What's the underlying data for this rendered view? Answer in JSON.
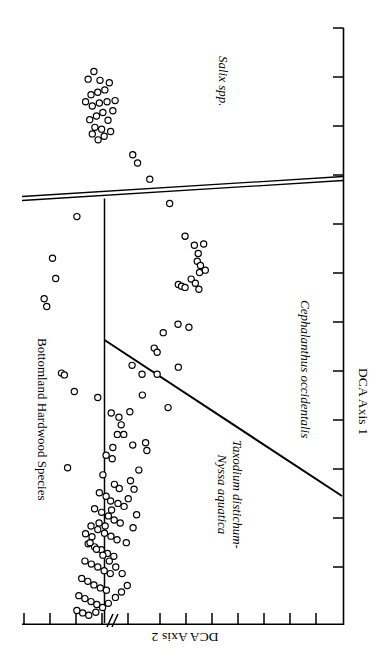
{
  "figure": {
    "kind": "DCA ordination scatter plot",
    "orientation_note": "landscape plot rotated 90 degrees clockwise on a portrait page",
    "background_color": "#ffffff",
    "ink_color": "#000000"
  },
  "axes": {
    "x_axis": {
      "name": "DCA Axis 1",
      "label": "DCA Axis 1",
      "label_rotation_deg": 90,
      "tick_count": 13,
      "has_break": false
    },
    "y_axis": {
      "name": "DCA Axis 2",
      "label": "DCA Axis 2",
      "label_rotation_deg": 180,
      "tick_count": 13,
      "has_break": true,
      "break_symbol": "//"
    }
  },
  "annotations": [
    {
      "id": "salix",
      "text": "Salix spp.",
      "style": "italic",
      "lines": [
        "Salix spp."
      ]
    },
    {
      "id": "bottomland",
      "text": "Bottomland Hardwood Species",
      "style": "normal",
      "lines": [
        "Bottomland Hardwood Species"
      ]
    },
    {
      "id": "cephalanthus",
      "text": "Cephalanthus occidentalis",
      "style": "italic",
      "lines": [
        "Cephalanthus occidentalis"
      ]
    },
    {
      "id": "taxodium",
      "text": "Taxodium distichum-Nyssa aquatica",
      "style": "italic",
      "lines": [
        "Taxodium distichum-",
        "Nyssa aquatica"
      ]
    }
  ],
  "chart_data": {
    "type": "scatter",
    "title": "",
    "subtitle": "",
    "xlabel": "DCA Axis 1",
    "ylabel": "DCA Axis 2",
    "xlim": [
      0,
      1
    ],
    "ylim": [
      0,
      1
    ],
    "grid": false,
    "legend": "none",
    "marker": {
      "shape": "circle",
      "fill": "#ffffff",
      "stroke": "#000000",
      "radius_px": 3.1,
      "stroke_width_px": 1.2
    },
    "axis_note": "Normalized plot coordinates: x = DCA Axis 1 (0 at left of plot frame), y = DCA Axis 2 (0 at bottom of plot frame).",
    "groups": [
      {
        "name": "Salix spp.",
        "label_style": "italic",
        "points": [
          [
            0.206,
            0.914
          ],
          [
            0.224,
            0.927
          ],
          [
            0.243,
            0.912
          ],
          [
            0.236,
            0.892
          ],
          [
            0.215,
            0.888
          ],
          [
            0.198,
            0.876
          ],
          [
            0.219,
            0.869
          ],
          [
            0.241,
            0.874
          ],
          [
            0.258,
            0.896
          ],
          [
            0.272,
            0.908
          ],
          [
            0.265,
            0.876
          ],
          [
            0.252,
            0.858
          ],
          [
            0.232,
            0.852
          ],
          [
            0.211,
            0.846
          ],
          [
            0.227,
            0.833
          ],
          [
            0.248,
            0.83
          ],
          [
            0.268,
            0.845
          ],
          [
            0.283,
            0.861
          ],
          [
            0.29,
            0.878
          ],
          [
            0.276,
            0.826
          ],
          [
            0.256,
            0.818
          ],
          [
            0.237,
            0.812
          ],
          [
            0.219,
            0.822
          ]
        ]
      },
      {
        "name": "Salix spp. outliers",
        "label_style": "italic",
        "points": [
          [
            0.345,
            0.787
          ],
          [
            0.36,
            0.773
          ],
          [
            0.398,
            0.746
          ],
          [
            0.46,
            0.705
          ],
          [
            0.171,
            0.683
          ]
        ]
      },
      {
        "name": "Bottomland Hardwood Species",
        "label_style": "normal",
        "points": [
          [
            0.095,
            0.613
          ],
          [
            0.105,
            0.579
          ],
          [
            0.069,
            0.545
          ],
          [
            0.077,
            0.532
          ],
          [
            0.123,
            0.42
          ],
          [
            0.132,
            0.417
          ],
          [
            0.163,
            0.389
          ],
          [
            0.142,
            0.261
          ]
        ]
      },
      {
        "name": "Cephalanthus occidentalis",
        "label_style": "italic",
        "points": [
          [
            0.508,
            0.65
          ],
          [
            0.537,
            0.635
          ],
          [
            0.549,
            0.621
          ],
          [
            0.566,
            0.637
          ],
          [
            0.546,
            0.608
          ],
          [
            0.556,
            0.601
          ],
          [
            0.553,
            0.589
          ],
          [
            0.571,
            0.593
          ],
          [
            0.527,
            0.578
          ],
          [
            0.54,
            0.571
          ],
          [
            0.487,
            0.569
          ],
          [
            0.497,
            0.566
          ],
          [
            0.508,
            0.564
          ],
          [
            0.551,
            0.561
          ],
          [
            0.486,
            0.502
          ],
          [
            0.52,
            0.497
          ],
          [
            0.44,
            0.488
          ],
          [
            0.412,
            0.462
          ],
          [
            0.421,
            0.455
          ],
          [
            0.487,
            0.43
          ],
          [
            0.421,
            0.418
          ],
          [
            0.374,
            0.418
          ],
          [
            0.455,
            0.362
          ]
        ]
      },
      {
        "name": "Taxodium distichum-Nyssa aquatica",
        "label_style": "italic",
        "points": [
          [
            0.343,
            0.433
          ],
          [
            0.375,
            0.383
          ],
          [
            0.236,
            0.379
          ],
          [
            0.278,
            0.353
          ],
          [
            0.302,
            0.346
          ],
          [
            0.309,
            0.333
          ],
          [
            0.336,
            0.355
          ],
          [
            0.297,
            0.317
          ],
          [
            0.317,
            0.317
          ],
          [
            0.345,
            0.299
          ],
          [
            0.283,
            0.295
          ],
          [
            0.262,
            0.282
          ],
          [
            0.281,
            0.276
          ],
          [
            0.389,
            0.29
          ],
          [
            0.385,
            0.303
          ],
          [
            0.252,
            0.249
          ],
          [
            0.288,
            0.233
          ],
          [
            0.303,
            0.226
          ],
          [
            0.338,
            0.239
          ],
          [
            0.349,
            0.225
          ],
          [
            0.241,
            0.219
          ],
          [
            0.262,
            0.213
          ],
          [
            0.276,
            0.205
          ],
          [
            0.299,
            0.201
          ],
          [
            0.318,
            0.196
          ],
          [
            0.331,
            0.209
          ],
          [
            0.226,
            0.192
          ],
          [
            0.248,
            0.186
          ],
          [
            0.269,
            0.18
          ],
          [
            0.287,
            0.173
          ],
          [
            0.306,
            0.168
          ],
          [
            0.215,
            0.163
          ],
          [
            0.236,
            0.157
          ],
          [
            0.257,
            0.151
          ],
          [
            0.277,
            0.146
          ],
          [
            0.296,
            0.14
          ],
          [
            0.206,
            0.133
          ],
          [
            0.226,
            0.128
          ],
          [
            0.247,
            0.123
          ],
          [
            0.266,
            0.117
          ],
          [
            0.286,
            0.112
          ],
          [
            0.196,
            0.104
          ],
          [
            0.216,
            0.099
          ],
          [
            0.236,
            0.094
          ],
          [
            0.256,
            0.088
          ],
          [
            0.275,
            0.083
          ],
          [
            0.186,
            0.075
          ],
          [
            0.205,
            0.07
          ],
          [
            0.224,
            0.064
          ],
          [
            0.244,
            0.059
          ],
          [
            0.263,
            0.055
          ],
          [
            0.177,
            0.046
          ],
          [
            0.196,
            0.041
          ],
          [
            0.215,
            0.036
          ],
          [
            0.233,
            0.031
          ],
          [
            0.171,
            0.021
          ],
          [
            0.189,
            0.017
          ],
          [
            0.208,
            0.013
          ],
          [
            0.23,
            0.018
          ],
          [
            0.251,
            0.026
          ],
          [
            0.269,
            0.033
          ],
          [
            0.291,
            0.043
          ],
          [
            0.31,
            0.052
          ],
          [
            0.328,
            0.063
          ],
          [
            0.312,
            0.083
          ],
          [
            0.292,
            0.094
          ],
          [
            0.272,
            0.104
          ],
          [
            0.252,
            0.114
          ],
          [
            0.232,
            0.124
          ],
          [
            0.212,
            0.135
          ],
          [
            0.198,
            0.15
          ],
          [
            0.218,
            0.145
          ],
          [
            0.24,
            0.168
          ],
          [
            0.259,
            0.163
          ],
          [
            0.279,
            0.19
          ],
          [
            0.325,
            0.135
          ],
          [
            0.346,
            0.16
          ],
          [
            0.357,
            0.182
          ],
          [
            0.364,
            0.257
          ]
        ]
      }
    ],
    "partition_lines": [
      {
        "id": "salix-boundary",
        "style": "double",
        "from": [
          0.0,
          0.655
        ],
        "to": [
          1.0,
          0.712
        ]
      },
      {
        "id": "bottomland-boundary",
        "style": "single",
        "from": [
          0.165,
          0.655
        ],
        "to": [
          0.165,
          0.0
        ]
      },
      {
        "id": "taxodium-cephalanthus-boundary",
        "style": "single",
        "from": [
          0.165,
          0.497
        ],
        "to": [
          1.0,
          0.252
        ]
      }
    ]
  }
}
